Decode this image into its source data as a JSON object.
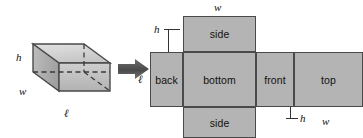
{
  "figure": {
    "kind": "geometry-diagram",
    "colors": {
      "panel_fill": "#b4b4b4",
      "panel_stroke": "#4a4a4a",
      "box_top_face": "#d2d2d2",
      "box_left_face": "#a8a8a8",
      "box_front_face": "#c0c0c0",
      "box_inner_face": "#bdbdbd",
      "arrow": "#555555",
      "text": "#111111",
      "background": "#ffffff"
    }
  },
  "solid": {
    "name": "rectangular-box",
    "labels": {
      "height": "h",
      "width": "w",
      "length": "ℓ"
    }
  },
  "arrow": {
    "name": "transform-arrow",
    "glyph": "➤",
    "direction": "right"
  },
  "net": {
    "name": "box-net",
    "panels": [
      {
        "id": "side-top",
        "label": "side",
        "position": "top"
      },
      {
        "id": "back",
        "label": "back",
        "position": "left"
      },
      {
        "id": "bottom",
        "label": "bottom",
        "position": "center"
      },
      {
        "id": "front",
        "label": "front",
        "position": "right-of-bottom"
      },
      {
        "id": "top",
        "label": "top",
        "position": "far-right"
      },
      {
        "id": "side-bottom",
        "label": "side",
        "position": "bottom"
      }
    ],
    "dimension_labels": {
      "w_top": "w",
      "h_upper_left": "h",
      "l_left": "ℓ",
      "h_lower_right": "h",
      "w_bottom": "w"
    }
  }
}
